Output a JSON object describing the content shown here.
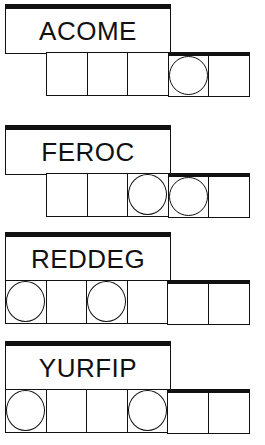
{
  "puzzles": [
    {
      "scrambled": "ACOME",
      "row_offset": 46,
      "cells": 5,
      "circled": [
        3
      ],
      "thick_top_from": 3
    },
    {
      "scrambled": "FEROC",
      "row_offset": 46,
      "cells": 5,
      "circled": [
        2,
        3
      ],
      "thick_top_from": 3
    },
    {
      "scrambled": "REDDEG",
      "row_offset": 5,
      "cells": 6,
      "circled": [
        0,
        2
      ],
      "thick_top_from": 4
    },
    {
      "scrambled": "YURFIP",
      "row_offset": 5,
      "cells": 6,
      "circled": [
        0,
        3
      ],
      "thick_top_from": 4
    }
  ]
}
